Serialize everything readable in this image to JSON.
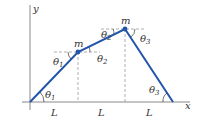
{
  "diagram": {
    "axes": {
      "x_label": "x",
      "y_label": "y"
    },
    "masses": [
      {
        "label": "m"
      },
      {
        "label": "m"
      }
    ],
    "segments": [
      {
        "label": "L"
      },
      {
        "label": "L"
      },
      {
        "label": "L"
      }
    ],
    "angles": [
      {
        "symbol": "θ",
        "sub": "1",
        "where": "origin"
      },
      {
        "symbol": "θ",
        "sub": "1",
        "where": "below first mass"
      },
      {
        "symbol": "θ",
        "sub": "2",
        "where": "right of first mass"
      },
      {
        "symbol": "θ",
        "sub": "2",
        "where": "left of second mass"
      },
      {
        "symbol": "θ",
        "sub": "3",
        "where": "right of second mass"
      },
      {
        "symbol": "θ",
        "sub": "3",
        "where": "right end"
      }
    ],
    "colors": {
      "rope": "#2255aa",
      "axis": "#888888",
      "dashed": "#999999"
    }
  }
}
